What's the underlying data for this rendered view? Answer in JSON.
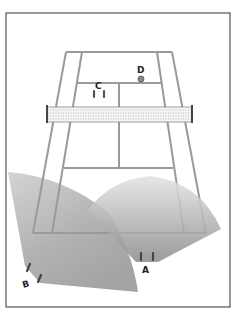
{
  "figure": {
    "frame": {
      "x": 6,
      "y": 13,
      "w": 224,
      "h": 294,
      "stroke": "#555555"
    },
    "court": {
      "line_color": "#9a9a9a",
      "far_baseline": {
        "y": 52,
        "x_left": 66,
        "x_right": 172
      },
      "near_baseline": {
        "y": 233,
        "x_left": 33,
        "x_right": 206
      },
      "left_alley": {
        "top_x": 82,
        "bottom_x": 52
      },
      "right_alley": {
        "top_x": 157,
        "bottom_x": 184
      },
      "far_service_line_y": 83,
      "near_service_line_y": 168,
      "center_line_x_top": 119,
      "center_line_x_bottom": 119
    },
    "net": {
      "x_left": 47,
      "x_right": 192,
      "y_top": 107,
      "y_bottom": 122,
      "post_color": "#444444"
    },
    "players": [
      {
        "id": "A",
        "label": "A",
        "label_x": 143,
        "label_y": 272,
        "marks": [
          [
            141,
            253,
            141,
            260
          ],
          [
            153,
            253,
            153,
            260
          ]
        ]
      },
      {
        "id": "B",
        "label": "B",
        "label_x": 23,
        "label_y": 286,
        "marks": [
          [
            30,
            264,
            27,
            271
          ],
          [
            41,
            275,
            38,
            282
          ]
        ]
      },
      {
        "id": "C",
        "label": "C",
        "label_x": 95,
        "label_y": 89,
        "marks": [
          [
            94,
            90,
            94,
            97
          ],
          [
            104,
            90,
            104,
            97
          ]
        ]
      },
      {
        "id": "D",
        "label": "D",
        "label_x": 137,
        "label_y": 73,
        "ball": {
          "cx": 141,
          "cy": 79,
          "r": 3
        }
      }
    ],
    "coverage_zones": [
      {
        "player": "A",
        "color": "#8a8a8a"
      },
      {
        "player": "B",
        "color": "#8a8a8a"
      }
    ]
  }
}
